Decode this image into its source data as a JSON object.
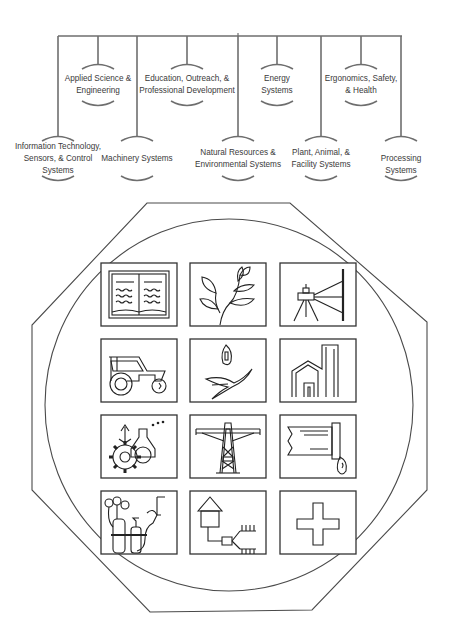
{
  "diagram": {
    "tree": {
      "trunk_x": 238,
      "bar_y": 36,
      "bar_x1": 58,
      "bar_x2": 402,
      "line_color": "#6e6e6e",
      "branches": [
        {
          "id": "it",
          "x": 58,
          "level": "lower",
          "label": "Information Technology,\nSensors, & Control\nSystems"
        },
        {
          "id": "ase",
          "x": 98,
          "level": "upper",
          "label": "Applied Science &\nEngineering"
        },
        {
          "id": "mach",
          "x": 137,
          "level": "lower",
          "label": "Machinery Systems"
        },
        {
          "id": "edu",
          "x": 187,
          "level": "upper",
          "label": "Education, Outreach, &\nProfessional Development"
        },
        {
          "id": "nat",
          "x": 238,
          "level": "lower",
          "label": "Natural Resources &\nEnvironmental Systems"
        },
        {
          "id": "energy",
          "x": 277,
          "level": "upper",
          "label": "Energy\nSystems"
        },
        {
          "id": "pafs",
          "x": 321,
          "level": "lower",
          "label": "Plant, Animal, &\nFacility Systems"
        },
        {
          "id": "esh",
          "x": 361,
          "level": "upper",
          "label": "Ergonomics, Safety,\n& Health"
        },
        {
          "id": "proc",
          "x": 401,
          "level": "lower",
          "label": "Processing Systems"
        }
      ]
    },
    "emblem": {
      "shape": "octagon-with-inscribed-circle",
      "stroke_color": "#4a4a4a",
      "octagon_points": [
        [
          147,
          203
        ],
        [
          290,
          203
        ],
        [
          427,
          322
        ],
        [
          427,
          490
        ],
        [
          312,
          610
        ],
        [
          150,
          612
        ],
        [
          32,
          490
        ],
        [
          32,
          325
        ]
      ],
      "circle": {
        "cx": 229,
        "cy": 405,
        "rx": 184,
        "ry": 186
      },
      "grid": {
        "cols_x": [
          101,
          190,
          280
        ],
        "rows_y": [
          263,
          339,
          415,
          491
        ],
        "box_w": 76,
        "box_h": 63,
        "icons": [
          [
            "open-book-icon",
            "plant-icon",
            "surveying-level-icon"
          ],
          [
            "tractor-icon",
            "seed-and-leaf-icon",
            "building-chimney-icon"
          ],
          [
            "gears-and-flask-icon",
            "oil-derrick-icon",
            "pipe-and-droplet-icon"
          ],
          [
            "gas-welding-tanks-icon",
            "house-waste-pipe-icon",
            "safety-cross-icon"
          ]
        ]
      }
    }
  }
}
